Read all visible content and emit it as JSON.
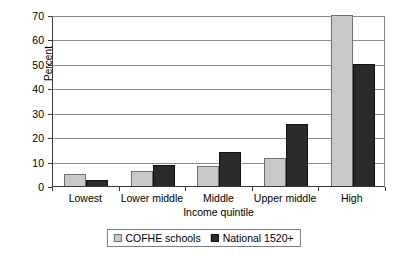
{
  "chart_data": {
    "type": "bar",
    "title": "",
    "xlabel": "Income quintile",
    "ylabel": "Percent",
    "categories": [
      "Lowest",
      "Lower middle",
      "Middle",
      "Upper middle",
      "High"
    ],
    "series": [
      {
        "name": "COFHE schools",
        "color": "#c9c9c9",
        "values": [
          5,
          6,
          8,
          11.5,
          70
        ]
      },
      {
        "name": "National 1520+",
        "color": "#2b2b2b",
        "values": [
          2.5,
          8.5,
          14,
          25.5,
          50
        ]
      }
    ],
    "ylim": [
      0,
      70
    ],
    "ytick_step": 10,
    "yticks": [
      "0",
      "10",
      "20",
      "30",
      "40",
      "50",
      "60",
      "70"
    ],
    "grid": true,
    "legend_position": "bottom-center"
  }
}
